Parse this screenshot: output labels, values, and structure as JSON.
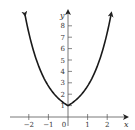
{
  "chart_data": {
    "type": "line",
    "title": "",
    "function": "y = e^{|x|}",
    "xlabel": "x",
    "ylabel": "y",
    "xlim": [
      -2.6,
      2.8
    ],
    "ylim": [
      -0.6,
      9.6
    ],
    "x_ticks": [
      -2,
      -1,
      0,
      1,
      2
    ],
    "x_tick_labels": [
      "−2",
      "−1",
      "0",
      "1",
      "2"
    ],
    "y_ticks": [
      1,
      2,
      3,
      4,
      5,
      6,
      7,
      8
    ],
    "y_tick_labels": [
      "1",
      "2",
      "3",
      "4",
      "5",
      "6",
      "7",
      "8"
    ],
    "grid": false,
    "legend": null,
    "series": [
      {
        "name": "curve",
        "x": [
          -2.2,
          -2,
          -1.5,
          -1,
          -0.5,
          0,
          0.5,
          1,
          1.5,
          2,
          2.2
        ],
        "y": [
          9.03,
          7.39,
          4.48,
          2.72,
          1.65,
          1.0,
          1.65,
          2.72,
          4.48,
          7.39,
          9.03
        ],
        "end_arrows": true
      }
    ]
  }
}
